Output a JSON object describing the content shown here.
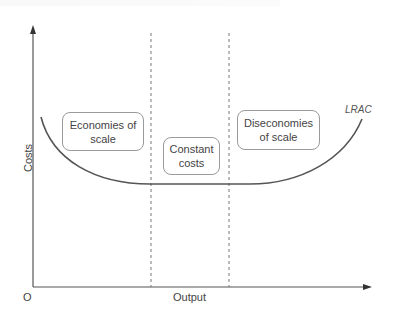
{
  "diagram": {
    "title": "",
    "axes": {
      "x_label": "Output",
      "y_label": "Costs",
      "origin_label": "O"
    },
    "curve": {
      "label": "LRAC",
      "color": "#555555"
    },
    "regions": [
      {
        "label": "Economies of scale",
        "line1": "Economies of",
        "line2": "scale"
      },
      {
        "label": "Constant costs",
        "line1": "Constant",
        "line2": "costs"
      },
      {
        "label": "Diseconomies of scale",
        "line1": "Diseconomies",
        "line2": "of scale"
      }
    ],
    "dividers": [
      {
        "name": "start-of-constant-costs",
        "style": "dashed"
      },
      {
        "name": "end-of-constant-costs",
        "style": "dashed"
      }
    ],
    "colors": {
      "axis": "#555555",
      "curve": "#555555",
      "divider": "#777777",
      "box_border": "#9a9a9a"
    }
  }
}
